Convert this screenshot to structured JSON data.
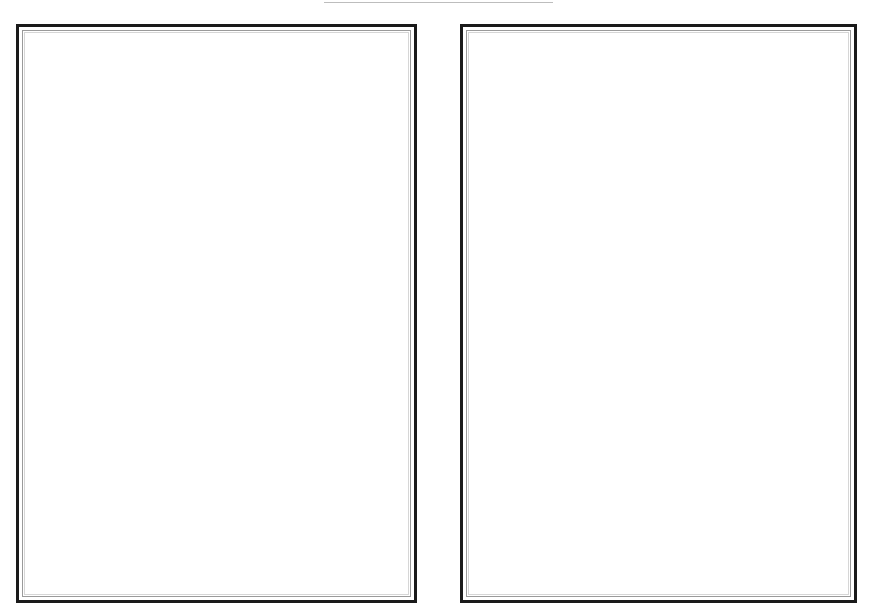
{
  "document": {
    "layout": "two-page spread",
    "pages": [
      {
        "position": "left",
        "content": ""
      },
      {
        "position": "right",
        "content": ""
      }
    ]
  },
  "colors": {
    "frame_outer": "#1a1a1a",
    "frame_inner": "#9a9a9a",
    "top_rule": "#bdbdbd",
    "background": "#ffffff"
  }
}
